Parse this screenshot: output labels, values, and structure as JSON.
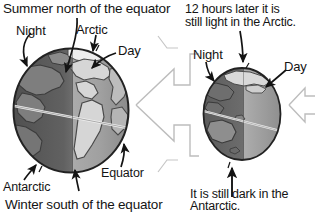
{
  "figure": {
    "title_left": "Summer north of the equator",
    "title_right_line1": "12 hours later it is",
    "title_right_line2": "still light in the Arctic.",
    "caption_bottom_left": "Winter south of the equator",
    "caption_bottom_right_line1": "It is still dark in the",
    "caption_bottom_right_line2": "Antarctic."
  },
  "left_globe": {
    "name": "earth-globe-americas",
    "labels": {
      "night": "Night",
      "arctic": "Arctic",
      "day": "Day",
      "equator": "Equator",
      "antarctic": "Antarctic"
    }
  },
  "right_globe": {
    "name": "earth-globe-australia",
    "labels": {
      "night": "Night",
      "day": "Day"
    }
  },
  "center_arrow": {
    "name": "rotation-arrow-left",
    "direction": "left"
  },
  "right_arrow": {
    "name": "rotation-arrow-left-partial",
    "direction": "left"
  },
  "colors": {
    "ink": "#141414",
    "ocean_day": "#9a9a9a",
    "ocean_night": "#5d5d5d",
    "land_day": "#d8d8d8",
    "land_night": "#7e7e7e",
    "outline": "#2b2b2b",
    "arrow_fill": "#fbfbfb",
    "arrow_stroke": "#b4b4b4",
    "background": "#ffffff"
  }
}
